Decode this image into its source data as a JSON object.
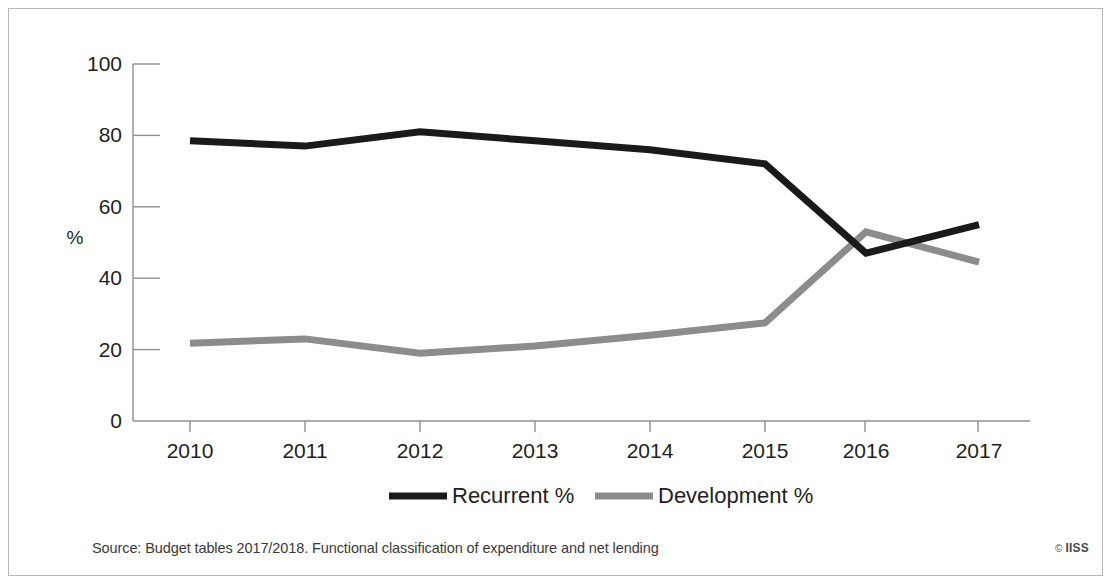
{
  "chart_data": {
    "type": "line",
    "title": "",
    "subtitle": "",
    "xlabel": "",
    "ylabel": "%",
    "categories": [
      "2010",
      "2011",
      "2012",
      "2013",
      "2014",
      "2015",
      "2016",
      "2017"
    ],
    "x": [
      2010,
      2011,
      2012,
      2013,
      2014,
      2015,
      2016,
      2017
    ],
    "series": [
      {
        "name": "Recurrent %",
        "color": "#1a1a1a",
        "values": [
          78.5,
          77.0,
          81.0,
          78.5,
          76.0,
          72.0,
          47.0,
          55.0
        ]
      },
      {
        "name": "Development %",
        "color": "#8c8c8c",
        "values": [
          21.8,
          23.0,
          19.0,
          21.0,
          24.0,
          27.5,
          53.0,
          44.5
        ]
      }
    ],
    "ylim": [
      0,
      100
    ],
    "yticks": [
      0,
      20,
      40,
      60,
      80,
      100
    ],
    "ytick_labels": [
      "0",
      "20",
      "40",
      "60",
      "80",
      "100"
    ],
    "xtick_labels": [
      "2010",
      "2011",
      "2012",
      "2013",
      "2014",
      "2015",
      "2016",
      "2017"
    ],
    "grid": false,
    "legend_position": "bottom"
  },
  "legend": {
    "items": [
      {
        "label": "Recurrent %",
        "color": "#1a1a1a"
      },
      {
        "label": "Development %",
        "color": "#8c8c8c"
      }
    ]
  },
  "footer": {
    "source": "Source: Budget tables 2017/2018. Functional classification of expenditure and net lending",
    "copyright_mark": "©",
    "copyright_text": "IISS"
  },
  "axes": {
    "y_axis_title": "%"
  }
}
